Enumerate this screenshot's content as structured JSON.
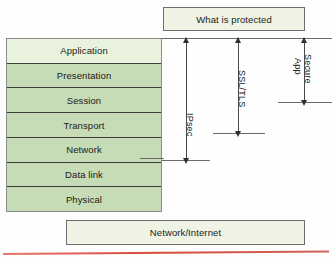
{
  "diagram": {
    "top_banner": {
      "label": "What is protected"
    },
    "bottom_banner": {
      "label": "Network/Internet"
    },
    "osi_stack": {
      "layers": [
        {
          "label": "Application",
          "shade": "pale"
        },
        {
          "label": "Presentation",
          "shade": "green"
        },
        {
          "label": "Session",
          "shade": "green"
        },
        {
          "label": "Transport",
          "shade": "green"
        },
        {
          "label": "Network",
          "shade": "green"
        },
        {
          "label": "Data link",
          "shade": "green"
        },
        {
          "label": "Physical",
          "shade": "green"
        }
      ]
    },
    "scope_arrows": [
      {
        "label": "IPsec",
        "covers_from": "Application",
        "covers_to": "Network"
      },
      {
        "label": "SSL/TLS",
        "covers_from": "Application",
        "covers_to": "Transport"
      },
      {
        "label_line1": "Secure",
        "label_line2": "App",
        "covers_from": "Application",
        "covers_to": "Application"
      }
    ],
    "colors": {
      "layer_green": "#c6dcb6",
      "layer_pale": "#e9f2dc",
      "banner_fill": "#eef3e3",
      "box_border": "#6e6e6e",
      "arrow": "#2f2f2f",
      "accent_line": "#d94a3c"
    }
  }
}
